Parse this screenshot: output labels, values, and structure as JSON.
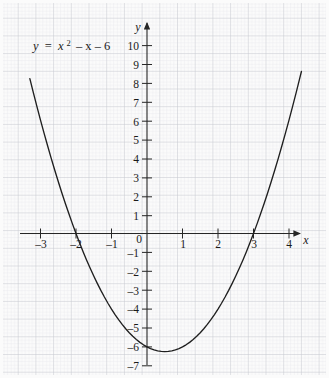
{
  "figure": {
    "background_color": "#fbfbfb",
    "grid_minor_color": "#dcdde2",
    "grid_major_color": "#c3c5cc",
    "axis_color": "#262626",
    "curve_color": "#1f1f1f",
    "width": 329,
    "height": 378
  },
  "labels": {
    "equation_y": "y",
    "equation_eq": "=",
    "equation_x": "x",
    "equation_sup": "2",
    "equation_rest": "– x – 6",
    "equation_full": "y = x² – x – 6",
    "x_axis_name": "x",
    "y_axis_name": "y"
  },
  "chart_data": {
    "type": "line",
    "title": "",
    "subtitle": "",
    "xlabel": "x",
    "ylabel": "y",
    "equation": "y = x^2 - x - 6",
    "annotations": [
      "y = x² – x – 6"
    ],
    "grid": true,
    "grid_minor_step": 0.2,
    "legend": "none",
    "xlim": [
      -3.45,
      4.6
    ],
    "ylim": [
      -7.6,
      10.6
    ],
    "xticks": [
      -3,
      -2,
      -1,
      0,
      1,
      2,
      3,
      4
    ],
    "xtick_labels": [
      "–3",
      "–2",
      "–1",
      "0",
      "1",
      "2",
      "3",
      "4"
    ],
    "yticks": [
      -7,
      -6,
      -5,
      -4,
      -3,
      -2,
      -1,
      0,
      1,
      2,
      3,
      4,
      5,
      6,
      7,
      8,
      9,
      10
    ],
    "ytick_labels": [
      "–7",
      "–6",
      "–5",
      "–4",
      "–3",
      "–2",
      "–1",
      "0",
      "1",
      "2",
      "3",
      "4",
      "5",
      "6",
      "7",
      "8",
      "9",
      "10"
    ],
    "roots": [
      -2,
      3
    ],
    "vertex": [
      0.5,
      -6.25
    ],
    "y_intercept": -6,
    "series": [
      {
        "name": "y = x² – x – 6",
        "color": "#1f1f1f",
        "x": [
          -3.3,
          -3.2,
          -3.1,
          -3.0,
          -2.9,
          -2.8,
          -2.7,
          -2.6,
          -2.5,
          -2.4,
          -2.3,
          -2.2,
          -2.1,
          -2.0,
          -1.9,
          -1.8,
          -1.7,
          -1.6,
          -1.5,
          -1.4,
          -1.3,
          -1.2,
          -1.1,
          -1.0,
          -0.9,
          -0.8,
          -0.7,
          -0.6,
          -0.5,
          -0.4,
          -0.3,
          -0.2,
          -0.1,
          0.0,
          0.1,
          0.2,
          0.3,
          0.4,
          0.5,
          0.6,
          0.7,
          0.8,
          0.9,
          1.0,
          1.1,
          1.2,
          1.3,
          1.4,
          1.5,
          1.6,
          1.7,
          1.8,
          1.9,
          2.0,
          2.1,
          2.2,
          2.3,
          2.4,
          2.5,
          2.6,
          2.7,
          2.8,
          2.9,
          3.0,
          3.1,
          3.2,
          3.3,
          3.4,
          3.5,
          3.6,
          3.7,
          3.8,
          3.9,
          4.0,
          4.1,
          4.2,
          4.3,
          4.35
        ],
        "y": [
          8.19,
          7.44,
          6.71,
          6.0,
          5.31,
          4.64,
          3.99,
          3.36,
          2.75,
          2.16,
          1.59,
          1.04,
          0.51,
          0.0,
          -0.49,
          -0.96,
          -1.41,
          -1.84,
          -2.25,
          -2.64,
          -3.01,
          -3.36,
          -3.69,
          -4.0,
          -4.29,
          -4.56,
          -4.81,
          -5.04,
          -5.25,
          -5.44,
          -5.61,
          -5.76,
          -5.89,
          -6.0,
          -6.09,
          -6.16,
          -6.21,
          -6.24,
          -6.25,
          -6.24,
          -6.21,
          -6.16,
          -6.09,
          -6.0,
          -5.89,
          -5.76,
          -5.61,
          -5.44,
          -5.25,
          -5.04,
          -4.81,
          -4.56,
          -4.29,
          -4.0,
          -3.69,
          -3.36,
          -3.01,
          -2.64,
          -2.25,
          -1.84,
          -1.41,
          -0.96,
          -0.49,
          0.0,
          0.51,
          1.04,
          1.59,
          2.16,
          2.75,
          3.36,
          3.99,
          4.64,
          5.31,
          6.0,
          6.71,
          7.44,
          8.19,
          8.57
        ]
      }
    ]
  }
}
